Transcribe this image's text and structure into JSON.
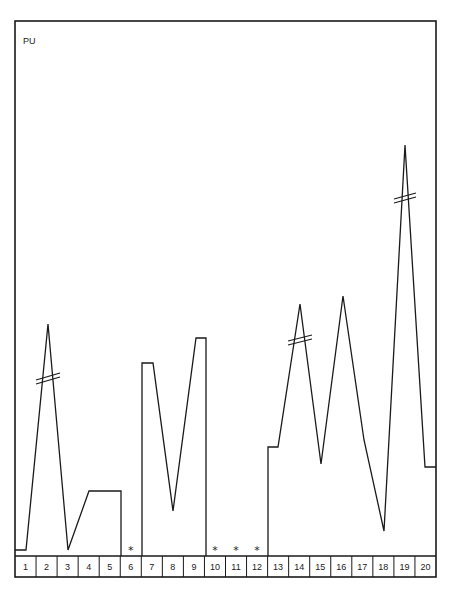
{
  "chart_data": {
    "type": "line",
    "title": "",
    "ylabel": "PU",
    "xlabel": "",
    "categories": [
      "1",
      "2",
      "3",
      "4",
      "5",
      "6",
      "7",
      "8",
      "9",
      "10",
      "11",
      "12",
      "13",
      "14",
      "15",
      "16",
      "17",
      "18",
      "19",
      "20"
    ],
    "missing_marker": "*",
    "missing_categories": [
      "6",
      "10",
      "11",
      "12"
    ],
    "axis_breaks_at": [
      "2",
      "14",
      "19"
    ],
    "values_relative_height": [
      0.02,
      0.77,
      0.02,
      0.2,
      0.2,
      null,
      0.58,
      0.14,
      0.63,
      null,
      null,
      null,
      0.33,
      0.76,
      0.29,
      0.78,
      0.35,
      0.07,
      1.0,
      0.28
    ],
    "grid": false,
    "legend": null,
    "y_ticks": []
  },
  "labels": {
    "y_axis": "PU",
    "star": "*"
  }
}
